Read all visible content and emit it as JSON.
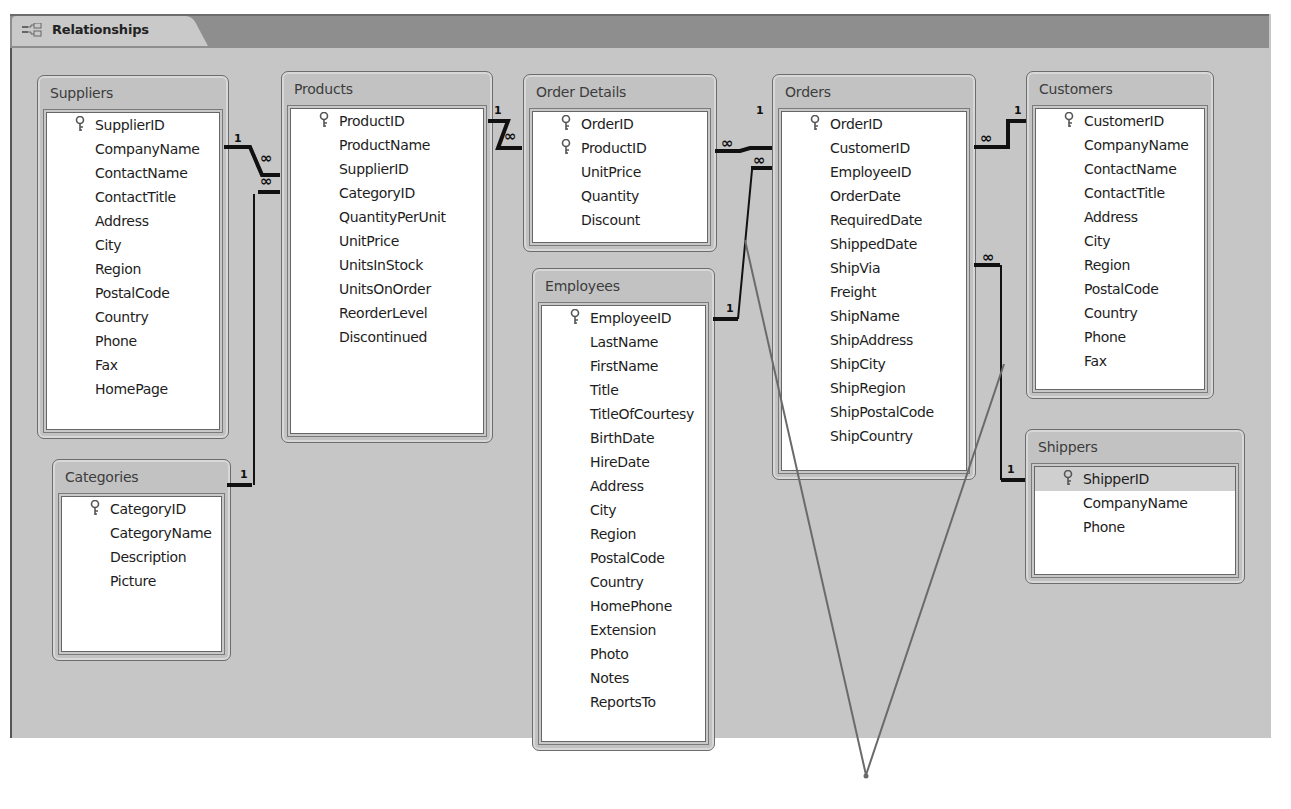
{
  "window": {
    "tab_label": "Relationships",
    "tab_icon": "relationships-icon"
  },
  "tables": [
    {
      "name": "Suppliers",
      "fields": [
        "SupplierID",
        "CompanyName",
        "ContactName",
        "ContactTitle",
        "Address",
        "City",
        "Region",
        "PostalCode",
        "Country",
        "Phone",
        "Fax",
        "HomePage"
      ],
      "keys": [
        "SupplierID"
      ]
    },
    {
      "name": "Products",
      "fields": [
        "ProductID",
        "ProductName",
        "SupplierID",
        "CategoryID",
        "QuantityPerUnit",
        "UnitPrice",
        "UnitsInStock",
        "UnitsOnOrder",
        "ReorderLevel",
        "Discontinued"
      ],
      "keys": [
        "ProductID"
      ]
    },
    {
      "name": "Order Details",
      "fields": [
        "OrderID",
        "ProductID",
        "UnitPrice",
        "Quantity",
        "Discount"
      ],
      "keys": [
        "OrderID",
        "ProductID"
      ]
    },
    {
      "name": "Orders",
      "fields": [
        "OrderID",
        "CustomerID",
        "EmployeeID",
        "OrderDate",
        "RequiredDate",
        "ShippedDate",
        "ShipVia",
        "Freight",
        "ShipName",
        "ShipAddress",
        "ShipCity",
        "ShipRegion",
        "ShipPostalCode",
        "ShipCountry"
      ],
      "keys": [
        "OrderID"
      ]
    },
    {
      "name": "Customers",
      "fields": [
        "CustomerID",
        "CompanyName",
        "ContactName",
        "ContactTitle",
        "Address",
        "City",
        "Region",
        "PostalCode",
        "Country",
        "Phone",
        "Fax"
      ],
      "keys": [
        "CustomerID"
      ]
    },
    {
      "name": "Categories",
      "fields": [
        "CategoryID",
        "CategoryName",
        "Description",
        "Picture"
      ],
      "keys": [
        "CategoryID"
      ]
    },
    {
      "name": "Employees",
      "fields": [
        "EmployeeID",
        "LastName",
        "FirstName",
        "Title",
        "TitleOfCourtesy",
        "BirthDate",
        "HireDate",
        "Address",
        "City",
        "Region",
        "PostalCode",
        "Country",
        "HomePhone",
        "Extension",
        "Photo",
        "Notes",
        "ReportsTo"
      ],
      "keys": [
        "EmployeeID"
      ]
    },
    {
      "name": "Shippers",
      "fields": [
        "ShipperID",
        "CompanyName",
        "Phone"
      ],
      "keys": [
        "ShipperID"
      ],
      "selected": "ShipperID"
    }
  ],
  "relationships": [
    {
      "from": "Suppliers.SupplierID",
      "to": "Products.SupplierID",
      "one": "1",
      "many": "∞"
    },
    {
      "from": "Categories.CategoryID",
      "to": "Products.CategoryID",
      "one": "1",
      "many": "∞"
    },
    {
      "from": "Products.ProductID",
      "to": "Order Details.ProductID",
      "one": "1",
      "many": "∞"
    },
    {
      "from": "Orders.OrderID",
      "to": "Order Details.OrderID",
      "one": "1",
      "many": "∞"
    },
    {
      "from": "Customers.CustomerID",
      "to": "Orders.CustomerID",
      "one": "1",
      "many": "∞"
    },
    {
      "from": "Employees.EmployeeID",
      "to": "Orders.EmployeeID",
      "one": "1",
      "many": "∞"
    },
    {
      "from": "Shippers.ShipperID",
      "to": "Orders.ShipVia",
      "one": "1",
      "many": "∞"
    }
  ],
  "labels": {
    "one": "1",
    "many": "∞"
  },
  "colors": {
    "canvas": "#c6c6c6",
    "tabbar": "#8e8e8e",
    "line": "#111111",
    "callout": "#6a6a6a"
  }
}
